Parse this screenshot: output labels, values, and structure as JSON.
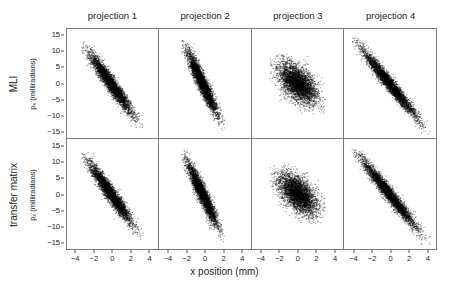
{
  "figure": {
    "xlabel": "x position (mm)",
    "y_axis_units": "(milliradians)",
    "y_axis_symbol": "p",
    "y_axis_subscript": "x"
  },
  "columns": [
    {
      "label": "projection 1"
    },
    {
      "label": "projection 2"
    },
    {
      "label": "projection 3"
    },
    {
      "label": "projection 4"
    }
  ],
  "rows": [
    {
      "label": "MLI"
    },
    {
      "label": "transfer matrix"
    }
  ],
  "axes": {
    "x_ticks": [
      "-4",
      "-2",
      "0",
      "2",
      "4"
    ],
    "x_tick_values": [
      -4,
      -2,
      0,
      2,
      4
    ],
    "y_ticks": [
      "15",
      "10",
      "5",
      "0",
      "-5",
      "-10",
      "-15"
    ],
    "y_tick_values": [
      15,
      10,
      5,
      0,
      -5,
      -10,
      -15
    ],
    "xlim": [
      -5,
      5
    ],
    "ylim": [
      -17,
      17
    ]
  },
  "chart_data": {
    "type": "scatter",
    "title": "",
    "xlabel": "x position (mm)",
    "ylabel": "p_x (milliradians)",
    "xlim": [
      -5,
      5
    ],
    "ylim": [
      -17,
      17
    ],
    "grid": false,
    "legend": "none",
    "marker": {
      "color": "#000000",
      "size": 0.7,
      "count_per_panel": 4000
    },
    "panel_grid": {
      "rows": 2,
      "cols": 4
    },
    "row_labels": [
      "MLI",
      "transfer matrix"
    ],
    "col_labels": [
      "projection 1",
      "projection 2",
      "projection 3",
      "projection 4"
    ],
    "panels": [
      {
        "row": "MLI",
        "col": "projection 1",
        "x_mean": -0.2,
        "y_mean": 0.0,
        "x_sd": 1.15,
        "y_sd": 4.6,
        "correlation": -0.95,
        "x_range": [
          -3.4,
          3.4
        ],
        "y_range": [
          -14.0,
          13.0
        ]
      },
      {
        "row": "MLI",
        "col": "projection 2",
        "x_mean": -0.25,
        "y_mean": 0.0,
        "x_sd": 0.82,
        "y_sd": 4.8,
        "correlation": -0.93,
        "x_range": [
          -2.6,
          2.2
        ],
        "y_range": [
          -15.0,
          13.5
        ]
      },
      {
        "row": "MLI",
        "col": "projection 3",
        "x_mean": 0.0,
        "y_mean": 0.0,
        "x_sd": 1.05,
        "y_sd": 3.1,
        "correlation": -0.55,
        "x_range": [
          -3.1,
          3.0
        ],
        "y_range": [
          -9.5,
          9.5
        ]
      },
      {
        "row": "MLI",
        "col": "projection 4",
        "x_mean": -0.1,
        "y_mean": 0.0,
        "x_sd": 1.45,
        "y_sd": 5.2,
        "correlation": -0.97,
        "x_range": [
          -4.2,
          4.4
        ],
        "y_range": [
          -16.0,
          14.5
        ]
      },
      {
        "row": "transfer matrix",
        "col": "projection 1",
        "x_mean": -0.2,
        "y_mean": 0.0,
        "x_sd": 1.15,
        "y_sd": 4.6,
        "correlation": -0.95,
        "x_range": [
          -3.4,
          3.4
        ],
        "y_range": [
          -14.0,
          13.0
        ]
      },
      {
        "row": "transfer matrix",
        "col": "projection 2",
        "x_mean": -0.25,
        "y_mean": 0.0,
        "x_sd": 0.82,
        "y_sd": 4.8,
        "correlation": -0.93,
        "x_range": [
          -2.6,
          2.2
        ],
        "y_range": [
          -15.0,
          13.5
        ]
      },
      {
        "row": "transfer matrix",
        "col": "projection 3",
        "x_mean": 0.0,
        "y_mean": 0.0,
        "x_sd": 1.05,
        "y_sd": 3.1,
        "correlation": -0.55,
        "x_range": [
          -3.1,
          3.0
        ],
        "y_range": [
          -9.5,
          9.5
        ]
      },
      {
        "row": "transfer matrix",
        "col": "projection 4",
        "x_mean": -0.1,
        "y_mean": 0.0,
        "x_sd": 1.45,
        "y_sd": 5.2,
        "correlation": -0.97,
        "x_range": [
          -4.2,
          4.4
        ],
        "y_range": [
          -16.0,
          14.5
        ]
      }
    ]
  }
}
